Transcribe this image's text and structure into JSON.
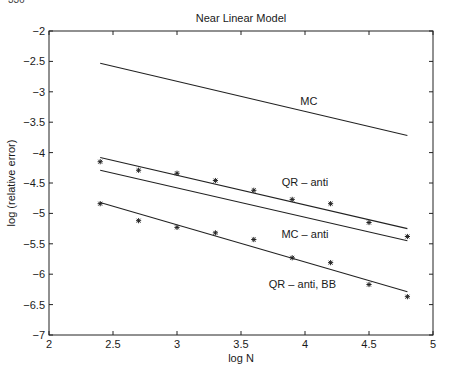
{
  "page_mark": "336",
  "chart_data": {
    "type": "line",
    "title": "Near Linear Model",
    "xlabel": "log N",
    "ylabel": "log (relative error)",
    "xlim": [
      2,
      5
    ],
    "ylim": [
      -7,
      -2
    ],
    "xticks": [
      2,
      2.5,
      3,
      3.5,
      4,
      4.5,
      5
    ],
    "xtick_labels": [
      "2",
      "2.5",
      "3",
      "3.5",
      "4",
      "4.5",
      "5"
    ],
    "yticks": [
      -2,
      -2.5,
      -3,
      -3.5,
      -4,
      -4.5,
      -5,
      -5.5,
      -6,
      -6.5,
      -7
    ],
    "ytick_labels": [
      "-2",
      "-2.5",
      "-3",
      "-3.5",
      "-4",
      "-4.5",
      "-5",
      "-5.5",
      "-6",
      "-6.5",
      "-7"
    ],
    "grid": false,
    "legend": "none (inline labels)",
    "series": [
      {
        "name": "MC",
        "kind": "fit-line",
        "x": [
          2.4,
          4.8
        ],
        "y": [
          -2.53,
          -3.72
        ],
        "label_pos": [
          4.03,
          -3.22
        ]
      },
      {
        "name": "QR - anti",
        "kind": "fit-line",
        "x": [
          2.4,
          4.8
        ],
        "y": [
          -4.08,
          -5.25
        ],
        "label_pos": [
          4.0,
          -4.55
        ]
      },
      {
        "name": "QR - anti (points)",
        "kind": "markers",
        "marker": "*",
        "x": [
          2.4,
          2.7,
          3.0,
          3.3,
          3.6,
          3.9,
          4.2,
          4.5,
          4.8
        ],
        "y": [
          -4.15,
          -4.29,
          -4.34,
          -4.46,
          -4.62,
          -4.77,
          -4.84,
          -5.15,
          -5.38
        ]
      },
      {
        "name": "MC - anti",
        "kind": "fit-line",
        "x": [
          2.4,
          4.8
        ],
        "y": [
          -4.29,
          -5.45
        ],
        "label_pos": [
          4.0,
          -5.4
        ]
      },
      {
        "name": "QR - anti, BB",
        "kind": "fit-line",
        "x": [
          2.4,
          4.8
        ],
        "y": [
          -4.82,
          -6.29
        ],
        "label_pos": [
          3.98,
          -6.22
        ]
      },
      {
        "name": "QR - anti, BB (points)",
        "kind": "markers",
        "marker": "*",
        "x": [
          2.4,
          2.7,
          3.0,
          3.3,
          3.6,
          3.9,
          4.2,
          4.5,
          4.8
        ],
        "y": [
          -4.84,
          -5.12,
          -5.23,
          -5.32,
          -5.43,
          -5.73,
          -5.81,
          -6.17,
          -6.37
        ]
      }
    ]
  }
}
